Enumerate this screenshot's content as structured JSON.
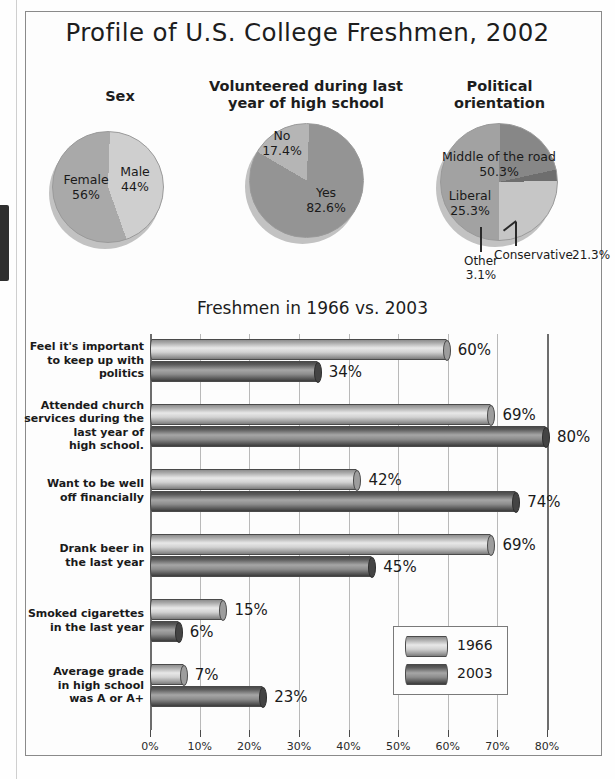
{
  "figure": {
    "title": "Profile of U.S. College Freshmen, 2002"
  },
  "pies": [
    {
      "title": "Sex",
      "slices": [
        {
          "label": "Female",
          "value": "56%",
          "num": 56,
          "color": "#a9a9a9"
        },
        {
          "label": "Male",
          "value": "44%",
          "num": 44,
          "color": "#cfcfcf"
        }
      ]
    },
    {
      "title": "Volunteered during last\nyear of high school",
      "title_line1": "Volunteered during last",
      "title_line2": "year of high school",
      "slices": [
        {
          "label": "No",
          "value": "17.4%",
          "num": 17.4,
          "color": "#b5b5b5"
        },
        {
          "label": "Yes",
          "value": "82.6%",
          "num": 82.6,
          "color": "#949494"
        }
      ]
    },
    {
      "title_line1": "Political",
      "title_line2": "orientation",
      "slices": [
        {
          "label": "Middle of the road",
          "value": "50.3%",
          "num": 50.3,
          "color": "#a2a2a2"
        },
        {
          "label": "Conservative",
          "value": "21.3%",
          "num": 21.3,
          "color": "#878787"
        },
        {
          "label": "Other",
          "value": "3.1%",
          "num": 3.1,
          "color": "#6e6e6e"
        },
        {
          "label": "Liberal",
          "value": "25.3%",
          "num": 25.3,
          "color": "#c6c6c6"
        }
      ]
    }
  ],
  "chart_data": {
    "type": "bar",
    "orientation": "horizontal",
    "title": "Freshmen in 1966 vs. 2003",
    "xlabel": "",
    "ylabel": "",
    "xlim": [
      0,
      80
    ],
    "xticks": [
      "0%",
      "10%",
      "20%",
      "30%",
      "40%",
      "50%",
      "60%",
      "70%",
      "80%"
    ],
    "grid": true,
    "legend_position": "inside-right",
    "categories": [
      "Feel it's important to keep up with politics",
      "Attended church services during the last year of high school.",
      "Want to be well off financially",
      "Drank beer in the last year",
      "Smoked cigarettes in the last year",
      "Average grade in high school was A or A+"
    ],
    "category_lines": [
      [
        "Feel it's important",
        "to keep up with",
        "politics"
      ],
      [
        "Attended church",
        "services during the",
        "last year of",
        "high school."
      ],
      [
        "Want to be well",
        "off financially"
      ],
      [
        "Drank beer in",
        "the last year"
      ],
      [
        "Smoked cigarettes",
        "in the last year"
      ],
      [
        "Average grade",
        "in high school",
        "was A or A+"
      ]
    ],
    "series": [
      {
        "name": "1966",
        "values": [
          60,
          69,
          42,
          69,
          15,
          7
        ],
        "labels": [
          "60%",
          "69%",
          "42%",
          "69%",
          "15%",
          "7%"
        ]
      },
      {
        "name": "2003",
        "values": [
          34,
          80,
          74,
          45,
          6,
          23
        ],
        "labels": [
          "34%",
          "80%",
          "74%",
          "45%",
          "6%",
          "23%"
        ]
      }
    ]
  },
  "legend": {
    "entries": [
      {
        "label": "1966"
      },
      {
        "label": "2003"
      }
    ]
  }
}
